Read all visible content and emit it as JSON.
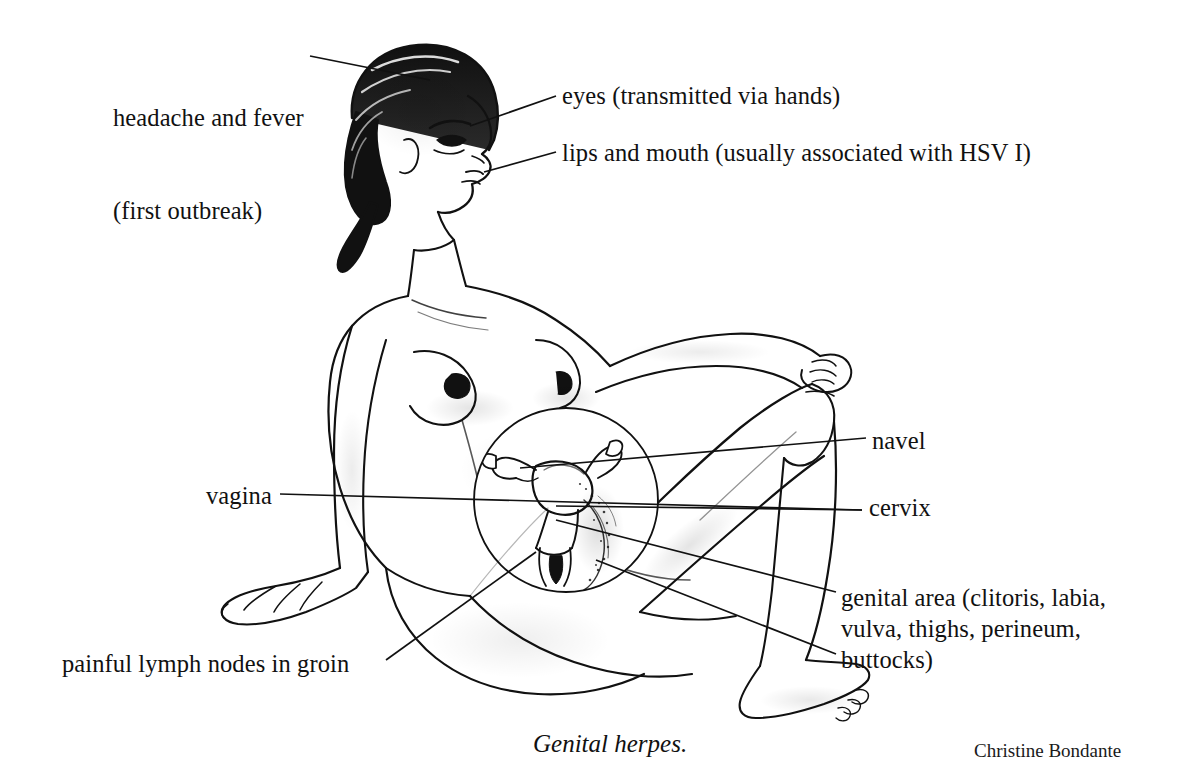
{
  "figure": {
    "caption": "Genital herpes.",
    "credit": "Christine Bondante",
    "background_color": "#ffffff",
    "ink_color": "#111111"
  },
  "labels": {
    "headache": {
      "line1": "headache and fever",
      "line2": "(first outbreak)"
    },
    "eyes": "eyes (transmitted via hands)",
    "lips": "lips and mouth (usually associated with HSV I)",
    "navel": "navel",
    "vagina": "vagina",
    "cervix": "cervix",
    "genital": {
      "line1": "genital area (clitoris, labia,",
      "line2": "vulva, thighs, perineum,",
      "line3": "buttocks)"
    },
    "lymph": "painful lymph nodes in groin"
  },
  "illustration": {
    "inset_name": "female-reproductive-organs-cutaway",
    "inset_parts": [
      "uterus",
      "ovaries",
      "fallopian tubes",
      "cervix",
      "vagina"
    ],
    "pose": "seated, right knee raised with hand resting on it, left arm braced behind"
  }
}
